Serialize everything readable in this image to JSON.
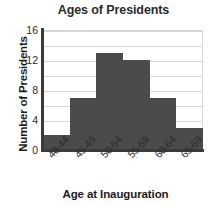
{
  "chart_data": {
    "type": "bar",
    "title": "Ages of Presidents",
    "xlabel": "Age at Inauguration",
    "ylabel": "Number of Presidents",
    "categories": [
      "40-44",
      "45-49",
      "50-54",
      "55-59",
      "60-64",
      "65-69"
    ],
    "values": [
      2,
      7,
      13,
      12,
      7,
      3
    ],
    "ylim": [
      0,
      16
    ],
    "yticks": [
      0,
      4,
      8,
      12,
      16
    ],
    "ytick_labels": [
      "0",
      "4",
      "8",
      "12",
      "16"
    ],
    "gridlines": [
      0,
      2,
      4,
      6,
      8,
      10,
      12,
      14,
      16
    ],
    "grid": true,
    "legend": "none",
    "bar_color": "#4b4b4b",
    "grid_color": "#d8d8d8",
    "axis_color": "#3a3a3a",
    "text_color": "#2b2b2b"
  }
}
